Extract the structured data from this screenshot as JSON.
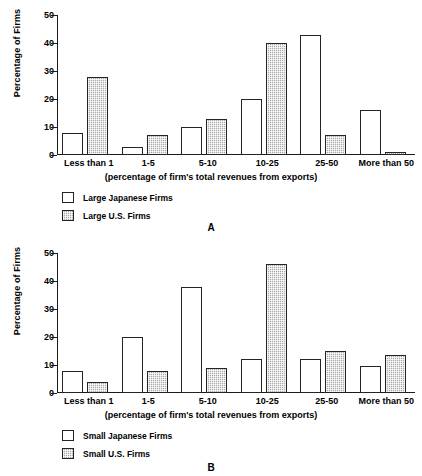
{
  "chart_data": [
    {
      "type": "bar",
      "panel": "A",
      "title": "",
      "xlabel": "(percentage of firm's total revenues from exports)",
      "ylabel": "Percentage of Firms",
      "ylim": [
        0,
        50
      ],
      "yticks": [
        0,
        10,
        20,
        30,
        40,
        50
      ],
      "grid": false,
      "legend_position": "below-left",
      "categories": [
        "Less than 1",
        "1-5",
        "5-10",
        "10-25",
        "25-50",
        "More than 50"
      ],
      "series": [
        {
          "name": "Large Japanese Firms",
          "fill": "white",
          "values": [
            8,
            3,
            10,
            20,
            43,
            16
          ]
        },
        {
          "name": "Large U.S. Firms",
          "fill": "checkered-gray",
          "values": [
            28,
            7,
            13,
            40,
            7,
            1
          ]
        }
      ]
    },
    {
      "type": "bar",
      "panel": "B",
      "title": "",
      "xlabel": "(percentage of firm's total revenues from exports)",
      "ylabel": "Percentage of Firms",
      "ylim": [
        0,
        50
      ],
      "yticks": [
        0,
        10,
        20,
        30,
        40,
        50
      ],
      "grid": false,
      "legend_position": "below-left",
      "categories": [
        "Less than 1",
        "1-5",
        "5-10",
        "10-25",
        "25-50",
        "More than 50"
      ],
      "series": [
        {
          "name": "Small Japanese Firms",
          "fill": "white",
          "values": [
            8,
            20,
            38,
            12,
            12,
            9.5
          ]
        },
        {
          "name": "Small U.S. Firms",
          "fill": "checkered-gray",
          "values": [
            4,
            8,
            9,
            46,
            15,
            13.5
          ]
        }
      ]
    }
  ],
  "colors": {
    "bar_outline": "#242424",
    "bar_japanese": "#ffffff",
    "bar_us": "#a8a8a8",
    "axis": "#1a1a1a",
    "text": "#000000",
    "background": "#ffffff"
  },
  "panel_a": {
    "letter": "A",
    "ylabel": "Percentage of Firms",
    "xlabel": "(percentage of firm's total revenues from exports)",
    "yticks": [
      "50",
      "40",
      "30",
      "20",
      "10",
      "0"
    ],
    "categories": [
      "Less than 1",
      "1-5",
      "5-10",
      "10-25",
      "25-50",
      "More than 50"
    ],
    "legend": [
      {
        "label": "Large Japanese Firms"
      },
      {
        "label": "Large U.S. Firms"
      }
    ]
  },
  "panel_b": {
    "letter": "B",
    "ylabel": "Percentage of Firms",
    "xlabel": "(percentage of firm's total revenues from exports)",
    "yticks": [
      "50",
      "40",
      "30",
      "20",
      "10",
      "0"
    ],
    "categories": [
      "Less than 1",
      "1-5",
      "5-10",
      "10-25",
      "25-50",
      "More than 50"
    ],
    "legend": [
      {
        "label": "Small Japanese Firms"
      },
      {
        "label": "Small U.S. Firms"
      }
    ]
  }
}
